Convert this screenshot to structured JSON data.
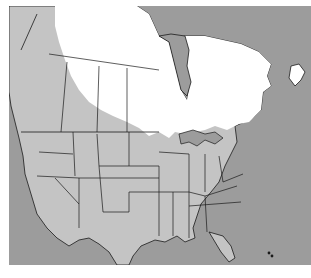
{
  "map": {
    "title": "North America range map",
    "colors": {
      "ocean": "#9c9c9c",
      "land_outside_range": "#c4c4c4",
      "range": "#ffffff",
      "borders": "#1a1a1a",
      "background": "#ffffff"
    },
    "legend": {
      "range_label": "Range (white)",
      "non_range_label": "Outside range (light gray)"
    }
  },
  "caption": {
    "text": ""
  }
}
